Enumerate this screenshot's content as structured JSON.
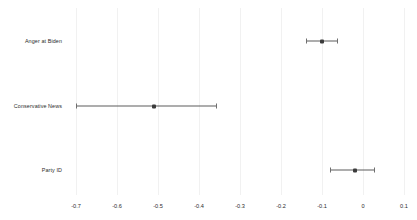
{
  "chart_data": {
    "type": "scatter",
    "title": "",
    "subtitle": "",
    "xlabel": "",
    "ylabel": "",
    "orientation": "horizontal",
    "grid": "vertical-only",
    "legend": "none",
    "xlim": [
      -0.74,
      0.14
    ],
    "xticks": [
      -0.7,
      -0.6,
      -0.5,
      -0.4,
      -0.3,
      -0.2,
      -0.1,
      0,
      0.1
    ],
    "xtick_labels": [
      "-0.7",
      "-0.6",
      "-0.5",
      "-0.4",
      "-0.3",
      "-0.2",
      "-0.1",
      "0",
      "0.1"
    ],
    "categories": [
      "Anger at Biden",
      "Conservative News",
      "Party ID"
    ],
    "series": [
      {
        "name": "Coefficient estimate",
        "points": [
          {
            "category": "Anger at Biden",
            "estimate": -0.1,
            "low": -0.14,
            "high": -0.06
          },
          {
            "category": "Conservative News",
            "estimate": -0.51,
            "low": -0.7,
            "high": -0.355
          },
          {
            "category": "Party ID",
            "estimate": -0.02,
            "low": -0.08,
            "high": 0.03
          }
        ]
      }
    ],
    "colors": {
      "marker": "#3b3b3b",
      "errorbar": "#5c5c5c",
      "gridline": "#f1f1f1",
      "background": "#ffffff",
      "text": "#2b2b2b"
    }
  }
}
